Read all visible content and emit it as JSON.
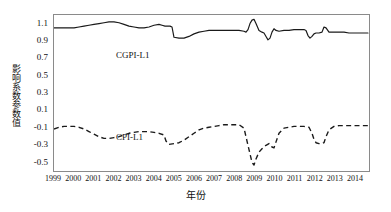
{
  "chart_data": {
    "type": "line",
    "title": "",
    "xlabel": "年份",
    "ylabel": "影响系数参数值",
    "grid": false,
    "legend_position": "inline-annotation",
    "xlim": [
      1999.0,
      2014.75
    ],
    "ylim": [
      -0.62,
      1.2
    ],
    "yticks": [
      "1.1",
      "0.9",
      "0.7",
      "0.5",
      "0.3",
      "0.1",
      "-0.1",
      "-0.3",
      "-0.5"
    ],
    "ytick_values": [
      1.1,
      0.9,
      0.7,
      0.5,
      0.3,
      0.1,
      -0.1,
      -0.3,
      -0.5
    ],
    "xticks": [
      "1999",
      "2000",
      "2001",
      "2002",
      "2003",
      "2004",
      "2005",
      "2006",
      "2007",
      "2008",
      "2009",
      "2010",
      "2011",
      "2012",
      "2013",
      "2014"
    ],
    "xtick_values": [
      1999,
      2000,
      2001,
      2002,
      2003,
      2004,
      2005,
      2006,
      2007,
      2008,
      2009,
      2010,
      2011,
      2012,
      2013,
      2014
    ],
    "series": [
      {
        "name": "CGPI-L1",
        "style": "solid",
        "color": "#1a1a1a",
        "x": [
          1999.0,
          1999.25,
          1999.5,
          1999.75,
          2000.0,
          2000.25,
          2000.5,
          2000.75,
          2001.0,
          2001.25,
          2001.5,
          2001.75,
          2002.0,
          2002.25,
          2002.5,
          2002.75,
          2003.0,
          2003.25,
          2003.5,
          2003.75,
          2004.0,
          2004.25,
          2004.4,
          2004.55,
          2004.7,
          2004.8,
          2004.9,
          2005.0,
          2005.25,
          2005.5,
          2005.75,
          2006.0,
          2006.25,
          2006.5,
          2006.75,
          2007.0,
          2007.25,
          2007.5,
          2007.75,
          2008.0,
          2008.25,
          2008.5,
          2008.6,
          2008.7,
          2008.8,
          2008.9,
          2009.0,
          2009.1,
          2009.25,
          2009.4,
          2009.5,
          2009.6,
          2009.7,
          2009.8,
          2009.9,
          2010.0,
          2010.1,
          2010.25,
          2010.5,
          2010.75,
          2011.0,
          2011.25,
          2011.5,
          2011.6,
          2011.7,
          2011.8,
          2011.9,
          2012.0,
          2012.1,
          2012.25,
          2012.4,
          2012.5,
          2012.6,
          2012.75,
          2013.0,
          2013.25,
          2013.5,
          2013.75,
          2014.0,
          2014.25,
          2014.5,
          2014.7
        ],
        "y": [
          1.05,
          1.05,
          1.05,
          1.05,
          1.05,
          1.06,
          1.07,
          1.08,
          1.09,
          1.1,
          1.11,
          1.12,
          1.12,
          1.11,
          1.09,
          1.07,
          1.06,
          1.05,
          1.05,
          1.06,
          1.08,
          1.09,
          1.08,
          1.07,
          1.07,
          1.07,
          1.06,
          0.94,
          0.93,
          0.93,
          0.95,
          0.98,
          1.0,
          1.01,
          1.02,
          1.02,
          1.02,
          1.02,
          1.02,
          1.02,
          1.02,
          1.01,
          1.0,
          1.03,
          1.1,
          1.14,
          1.15,
          1.1,
          1.02,
          1.0,
          0.99,
          0.95,
          0.91,
          0.93,
          1.0,
          1.04,
          1.02,
          1.01,
          1.02,
          1.02,
          1.03,
          1.03,
          1.03,
          1.02,
          0.96,
          0.93,
          0.95,
          0.98,
          0.99,
          0.99,
          1.0,
          1.06,
          1.05,
          1.0,
          1.0,
          1.0,
          1.0,
          0.99,
          0.99,
          0.99,
          0.99,
          0.99
        ]
      },
      {
        "name": "CPI-L1",
        "style": "dashed",
        "color": "#1a1a1a",
        "x": [
          1999.0,
          1999.25,
          1999.5,
          1999.75,
          2000.0,
          2000.25,
          2000.5,
          2000.75,
          2001.0,
          2001.25,
          2001.5,
          2001.75,
          2002.0,
          2002.25,
          2002.5,
          2002.75,
          2003.0,
          2003.25,
          2003.5,
          2003.75,
          2004.0,
          2004.25,
          2004.5,
          2004.6,
          2004.75,
          2005.0,
          2005.25,
          2005.5,
          2005.75,
          2006.0,
          2006.25,
          2006.5,
          2006.75,
          2007.0,
          2007.25,
          2007.5,
          2007.75,
          2008.0,
          2008.25,
          2008.5,
          2008.6,
          2008.7,
          2008.8,
          2008.9,
          2009.0,
          2009.1,
          2009.25,
          2009.4,
          2009.5,
          2009.6,
          2009.75,
          2009.9,
          2010.0,
          2010.1,
          2010.25,
          2010.5,
          2010.75,
          2011.0,
          2011.25,
          2011.5,
          2011.75,
          2011.9,
          2012.0,
          2012.1,
          2012.25,
          2012.4,
          2012.5,
          2012.6,
          2012.75,
          2013.0,
          2013.25,
          2013.5,
          2013.75,
          2014.0,
          2014.25,
          2014.5,
          2014.7
        ],
        "y": [
          -0.13,
          -0.11,
          -0.1,
          -0.1,
          -0.1,
          -0.11,
          -0.13,
          -0.16,
          -0.19,
          -0.22,
          -0.24,
          -0.24,
          -0.23,
          -0.22,
          -0.2,
          -0.18,
          -0.17,
          -0.16,
          -0.16,
          -0.16,
          -0.17,
          -0.18,
          -0.2,
          -0.27,
          -0.31,
          -0.3,
          -0.29,
          -0.26,
          -0.22,
          -0.18,
          -0.14,
          -0.12,
          -0.11,
          -0.1,
          -0.09,
          -0.08,
          -0.08,
          -0.08,
          -0.08,
          -0.12,
          -0.22,
          -0.32,
          -0.42,
          -0.52,
          -0.55,
          -0.48,
          -0.4,
          -0.36,
          -0.34,
          -0.32,
          -0.3,
          -0.34,
          -0.35,
          -0.28,
          -0.18,
          -0.12,
          -0.11,
          -0.1,
          -0.1,
          -0.1,
          -0.11,
          -0.18,
          -0.25,
          -0.29,
          -0.3,
          -0.3,
          -0.29,
          -0.22,
          -0.14,
          -0.1,
          -0.09,
          -0.09,
          -0.09,
          -0.09,
          -0.09,
          -0.09,
          -0.09
        ]
      }
    ],
    "annotations": [
      {
        "text": "CGPI-L1",
        "x": 1999.4,
        "y": 1.0
      },
      {
        "text": "CPI-L1",
        "x": 1999.4,
        "y": 0.0
      }
    ]
  }
}
